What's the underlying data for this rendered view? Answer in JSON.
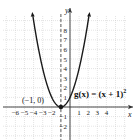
{
  "chart_data": {
    "type": "line",
    "title": "",
    "function_label": "g(x) = (x + 1)^2",
    "equation_text": "g(x) = (x + 1)",
    "equation_exponent": "2",
    "xlabel": "x",
    "ylabel": "y",
    "xlim": [
      -7,
      6
    ],
    "ylim": [
      -3,
      9
    ],
    "x_ticks": [
      -6,
      -5,
      -4,
      -3,
      -2,
      1,
      2,
      3,
      4
    ],
    "x_tick_labels": [
      "-6",
      "-5",
      "-4",
      "-3",
      "-2",
      "1",
      "2",
      "3",
      "4"
    ],
    "y_ticks": [
      -2,
      -1,
      1,
      2,
      3,
      4,
      5,
      6,
      7,
      8
    ],
    "y_tick_labels": [
      "-2",
      "-1",
      "1",
      "2",
      "3",
      "4",
      "5",
      "6",
      "7",
      "8"
    ],
    "grid": true,
    "axis_of_symmetry": {
      "x": -1,
      "style": "dashed"
    },
    "vertex": {
      "x": -1,
      "y": 0,
      "label": "(−1, 0)"
    },
    "series": [
      {
        "name": "g(x) = (x + 1)^2",
        "x": [
          -4.1,
          -4,
          -3,
          -2,
          -1,
          0,
          1,
          2,
          2.1
        ],
        "y": [
          9.61,
          9,
          4,
          1,
          0,
          1,
          4,
          9,
          9.61
        ]
      }
    ],
    "colors": {
      "curve": "#1a1a1a",
      "grid": "#c8c8c8",
      "axis": "#333333"
    }
  }
}
